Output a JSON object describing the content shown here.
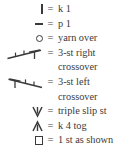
{
  "legend": {
    "title_visible": false,
    "colors": {
      "text": "#3a3a3a",
      "background": "#ffffff",
      "glyph": "#3a3a3a"
    },
    "equals": "=",
    "entries": [
      {
        "symbol_name": "vertical-bar-symbol",
        "symbol_glyph": "|",
        "description": "k 1",
        "continuation": ""
      },
      {
        "symbol_name": "horizontal-dash-symbol",
        "symbol_glyph": "–",
        "description": "p 1",
        "continuation": ""
      },
      {
        "symbol_name": "open-circle-symbol",
        "symbol_glyph": "○",
        "description": "yarn over",
        "continuation": ""
      },
      {
        "symbol_name": "three-stitch-right-crossover-symbol",
        "symbol_glyph": "╱─┴",
        "description": "3-st right",
        "continuation": "crossover"
      },
      {
        "symbol_name": "three-stitch-left-crossover-symbol",
        "symbol_glyph": "┬─╲",
        "description": "3-st left",
        "continuation": "crossover"
      },
      {
        "symbol_name": "triple-slip-stitch-symbol",
        "symbol_glyph": "ⱺ",
        "description": "triple slip st",
        "continuation": ""
      },
      {
        "symbol_name": "knit-four-together-symbol",
        "symbol_glyph": "ⱻ",
        "description": "k 4 tog",
        "continuation": ""
      },
      {
        "symbol_name": "open-square-symbol",
        "symbol_glyph": "□",
        "description": "1 st as shown",
        "continuation": ""
      }
    ]
  }
}
